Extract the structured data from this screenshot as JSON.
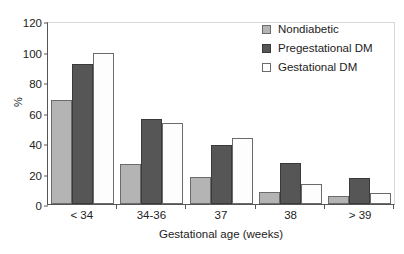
{
  "chart_data": {
    "type": "bar",
    "title": "",
    "subtitle": "",
    "xlabel": "Gestational age (weeks)",
    "ylabel": "%",
    "categories": [
      "< 34",
      "34-36",
      "37",
      "38",
      "> 39"
    ],
    "series": [
      {
        "name": "Nondiabetic",
        "color": "#b4b4b4",
        "values": [
          68,
          26,
          18,
          8,
          5
        ]
      },
      {
        "name": "Pregestational DM",
        "color": "#565656",
        "values": [
          92,
          56,
          39,
          27,
          17
        ]
      },
      {
        "name": "Gestational DM",
        "color": "#ffffff",
        "values": [
          99,
          53,
          43,
          13,
          7
        ]
      }
    ],
    "ylim": [
      0,
      120
    ],
    "yticks": [
      0,
      20,
      40,
      60,
      80,
      100,
      120
    ],
    "ytick_labels": [
      "0",
      "20",
      "40",
      "60",
      "80",
      "100",
      "120"
    ],
    "grid": false,
    "legend_position": "top-right"
  },
  "axes": {
    "y_title": "%",
    "x_title": "Gestational age (weeks)"
  },
  "legend": {
    "items": [
      {
        "label": "Nondiabetic",
        "swatch": "legend-swatch-nondiabetic"
      },
      {
        "label": "Pregestational DM",
        "swatch": "legend-swatch-pregestational-dm"
      },
      {
        "label": "Gestational DM",
        "swatch": "legend-swatch-gestational-dm"
      }
    ]
  }
}
